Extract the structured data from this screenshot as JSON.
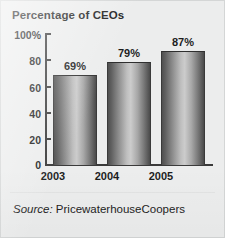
{
  "figure": {
    "title": "Percentage of CEOs",
    "source_lead": "Source:",
    "source_name": " PricewaterhouseCoopers"
  },
  "axis": {
    "y_ticks": [
      "100%",
      "80",
      "60",
      "40",
      "20",
      "0"
    ]
  },
  "chart_data": {
    "type": "bar",
    "title": "Percentage of CEOs",
    "categories": [
      "2003",
      "2004",
      "2005"
    ],
    "values": [
      69,
      79,
      87
    ],
    "data_labels": [
      "69%",
      "79%",
      "87%"
    ],
    "xlabel": "",
    "ylabel": "",
    "ylim": [
      0,
      100
    ],
    "y_ticks": [
      0,
      20,
      40,
      60,
      80,
      100
    ],
    "y_tick_labels": [
      "0",
      "20",
      "40",
      "60",
      "80",
      "100%"
    ],
    "grid": false,
    "legend": "none",
    "series": [
      {
        "name": "Percentage of CEOs",
        "values": [
          69,
          79,
          87
        ]
      }
    ],
    "annotations": [
      "Source: PricewaterhouseCoopers"
    ]
  }
}
